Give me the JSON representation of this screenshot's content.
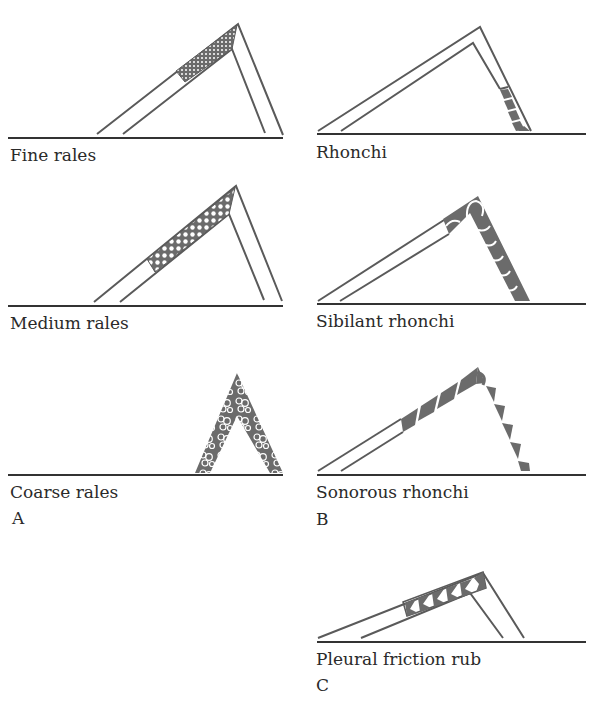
{
  "figure": {
    "colors": {
      "line": "#5a5a5a",
      "fill": "#6b6b6b",
      "baseline": "#333333",
      "text": "#2a2a2a"
    },
    "panels": [
      {
        "letter": "A",
        "diagrams": [
          {
            "label": "Fine rales",
            "pattern": "fine-dots"
          },
          {
            "label": "Medium rales",
            "pattern": "medium-dots"
          },
          {
            "label": "Coarse rales",
            "pattern": "coarse-bubbles"
          }
        ]
      },
      {
        "letter": "B",
        "diagrams": [
          {
            "label": "Rhonchi",
            "pattern": "narrow-stripes"
          },
          {
            "label": "Sibilant rhonchi",
            "pattern": "wavy-wedges"
          },
          {
            "label": "Sonorous rhonchi",
            "pattern": "triangle-wedges"
          }
        ]
      },
      {
        "letter": "C",
        "diagrams": [
          {
            "label": "Pleural friction rub",
            "pattern": "bowtie-triangles"
          }
        ]
      }
    ]
  }
}
